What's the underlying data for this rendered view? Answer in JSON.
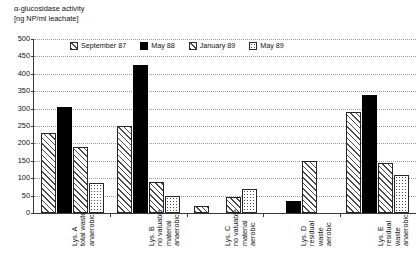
{
  "chart_data": {
    "type": "bar",
    "title": "",
    "ylabel": "α-glucosidase activity\n[ng NP/ml leachate]",
    "xlabel": "",
    "ylim": [
      0,
      500
    ],
    "yticks": [
      0,
      50,
      100,
      150,
      200,
      250,
      300,
      350,
      400,
      450,
      500
    ],
    "grid": true,
    "legend_position": "top-center",
    "categories": [
      "Lys. A\ntotal waste\nanaerobic",
      "Lys. B\nno valuable\nmaterial\nanaerobic",
      "Lys. C\nno valuable\nmaterial\naerobic",
      "Lys. D\nresidual\nwaste\naerobic",
      "Lys. E\nresidual\nwaste\nanaerobic"
    ],
    "series": [
      {
        "name": "September 87",
        "pattern": "hatch",
        "values": [
          230,
          250,
          20,
          null,
          290
        ]
      },
      {
        "name": "May 88",
        "pattern": "solid",
        "values": [
          305,
          425,
          null,
          35,
          340
        ]
      },
      {
        "name": "January 89",
        "pattern": "hatch",
        "values": [
          190,
          90,
          45,
          150,
          145
        ]
      },
      {
        "name": "May 89",
        "pattern": "dots",
        "values": [
          85,
          50,
          70,
          null,
          110
        ]
      }
    ]
  },
  "colors": {
    "axis": "#3a3a3a",
    "grid": "#9a9a9a",
    "bar_outline": "#262626",
    "hatch": "#4a4a4a",
    "solid": "#000000",
    "background": "#ffffff"
  }
}
